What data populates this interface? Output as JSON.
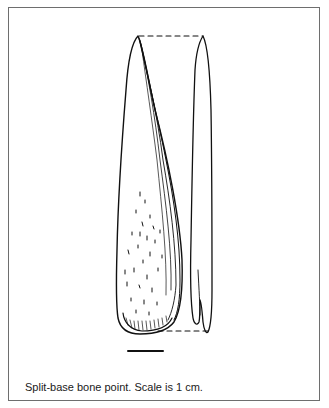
{
  "figure": {
    "caption": "Split-base bone point.  Scale is 1 cm.",
    "subject": "split-base bone point",
    "views": [
      "face view",
      "side view"
    ],
    "scale_bar": {
      "label": "1 cm",
      "length_px": 36
    },
    "colors": {
      "ink": "#111111",
      "frame": "#6e6e6e",
      "background": "#ffffff"
    }
  }
}
